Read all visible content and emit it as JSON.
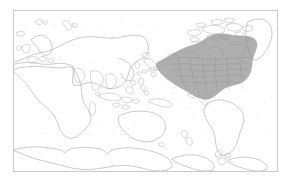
{
  "figure": {
    "kind": "world-distribution-map",
    "projection": "Pacific-centered equirectangular",
    "frame_border_color": "#c9c9c9",
    "background_color": "#ffffff",
    "coastline_color": "#8a8a8a",
    "title": "",
    "caption": ""
  },
  "legend": {
    "visible": false,
    "entries": [
      {
        "label": "Distribution range",
        "color": "#a8a8a8"
      }
    ]
  },
  "map": {
    "highlight_color": "#a8a8a8",
    "highlight_outline_color": "#6d6d6d",
    "highlighted_regions": [
      "Alaska",
      "Canada",
      "Contiguous United States"
    ],
    "landmasses": [
      "Africa",
      "Europe",
      "Asia",
      "Australia",
      "New Zealand",
      "Maritime Southeast Asia",
      "Greenland",
      "North America",
      "South America",
      "Antarctica",
      "Japan",
      "Madagascar",
      "British Isles",
      "Iceland",
      "Svalbard",
      "Novaya Zemlya",
      "Philippines",
      "Caribbean islands",
      "Pacific islands"
    ],
    "axis_labels": [],
    "tick_labels": [],
    "graticule_visible": false
  }
}
